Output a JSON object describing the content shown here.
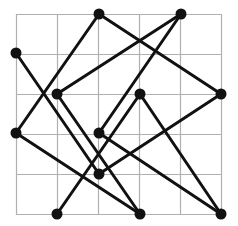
{
  "diagram": {
    "type": "graph-on-grid",
    "grid": {
      "cols": 5,
      "rows": 5,
      "x_lines": [
        16,
        57,
        98,
        139,
        180,
        221
      ],
      "y_lines": [
        14,
        54,
        94,
        134,
        174,
        214
      ],
      "color": "#b0b0b0"
    },
    "node_color": "#111111",
    "edge_color": "#111111",
    "nodes": [
      {
        "id": "A",
        "x": 99,
        "y": 14
      },
      {
        "id": "B",
        "x": 181,
        "y": 14
      },
      {
        "id": "C",
        "x": 16,
        "y": 53
      },
      {
        "id": "D",
        "x": 57,
        "y": 94
      },
      {
        "id": "E",
        "x": 140,
        "y": 94
      },
      {
        "id": "F",
        "x": 221,
        "y": 94
      },
      {
        "id": "G",
        "x": 16,
        "y": 133
      },
      {
        "id": "H",
        "x": 99,
        "y": 133
      },
      {
        "id": "I",
        "x": 99,
        "y": 174
      },
      {
        "id": "J",
        "x": 57,
        "y": 214
      },
      {
        "id": "K",
        "x": 140,
        "y": 214
      },
      {
        "id": "L",
        "x": 221,
        "y": 214
      }
    ],
    "edges": [
      [
        "A",
        "G"
      ],
      [
        "A",
        "F"
      ],
      [
        "B",
        "D"
      ],
      [
        "B",
        "H"
      ],
      [
        "C",
        "I"
      ],
      [
        "D",
        "K"
      ],
      [
        "G",
        "K"
      ],
      [
        "H",
        "L"
      ],
      [
        "E",
        "J"
      ],
      [
        "E",
        "L"
      ],
      [
        "I",
        "F"
      ]
    ]
  }
}
